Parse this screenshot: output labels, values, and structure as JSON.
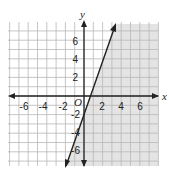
{
  "chart_data": {
    "type": "line",
    "title": "",
    "xlabel": "x",
    "ylabel": "y",
    "origin_label": "O",
    "xlim": [
      -8,
      8
    ],
    "ylim": [
      -8,
      8
    ],
    "grid": true,
    "x_ticks": [
      "-6",
      "-4",
      "-2",
      "2",
      "4",
      "6"
    ],
    "y_ticks": [
      "6",
      "4",
      "2",
      "-2",
      "-4",
      "-6"
    ],
    "series": [
      {
        "name": "boundary line y = 3x - 2",
        "points": [
          [
            -2,
            -8
          ],
          [
            0,
            -2
          ],
          [
            3.3,
            7.9
          ]
        ],
        "style": "solid"
      }
    ],
    "shaded_region": "right of / below the line (y < 3x - 2)",
    "colors": {
      "shade": "#e4e4e4",
      "grid": "#b8b8b8",
      "line": "#222222"
    }
  }
}
